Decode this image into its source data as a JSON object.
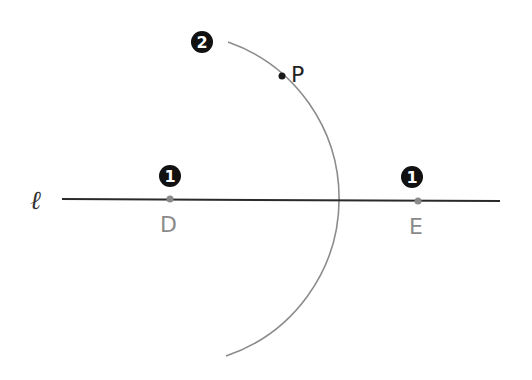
{
  "diagram": {
    "type": "geometric-construction",
    "line": {
      "label": "ℓ",
      "x1": 62,
      "y1": 199,
      "x2": 500,
      "y2": 201,
      "color": "#2a2a2a"
    },
    "points": [
      {
        "id": "D",
        "label": "D",
        "x": 170,
        "y": 199,
        "color": "#8a8a8a"
      },
      {
        "id": "E",
        "label": "E",
        "x": 418,
        "y": 201,
        "color": "#8a8a8a"
      },
      {
        "id": "P",
        "label": "P",
        "x": 282,
        "y": 76,
        "color": "#1a1a1a"
      }
    ],
    "arc": {
      "center": "D",
      "cx": 170,
      "cy": 199,
      "r": 166,
      "start": [
        228,
        42
      ],
      "end": [
        226,
        356
      ],
      "color": "#8c8c8c"
    },
    "step_markers": [
      {
        "number": "2",
        "glyph": "❷",
        "x": 202,
        "y": 42
      },
      {
        "number": "1",
        "glyph": "❶",
        "x": 170,
        "y": 176
      },
      {
        "number": "1",
        "glyph": "❶",
        "x": 412,
        "y": 177
      }
    ]
  }
}
